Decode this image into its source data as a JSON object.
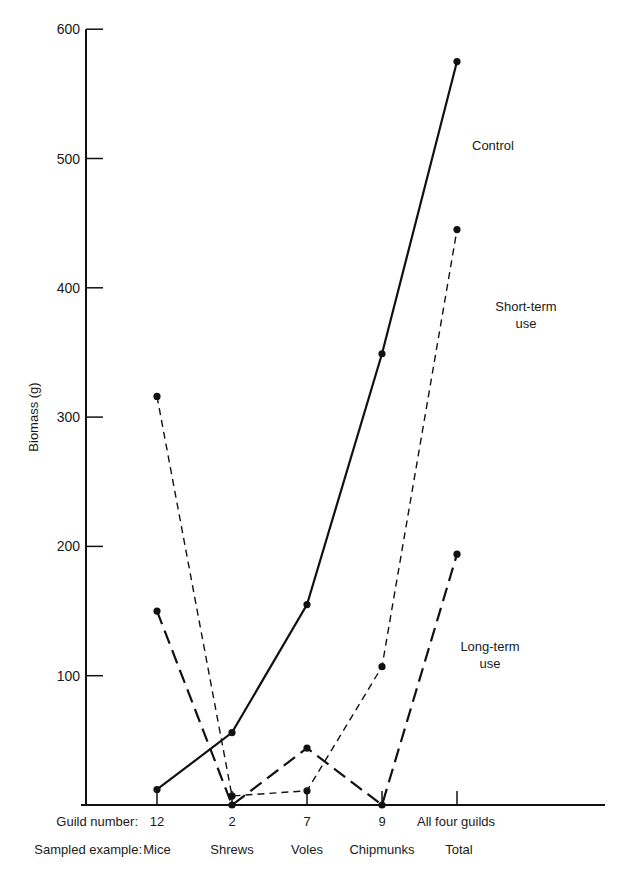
{
  "chart_data": {
    "type": "line",
    "title": "",
    "xlabel": "",
    "ylabel": "Biomass (g)",
    "ylim": [
      0,
      600
    ],
    "yticks": [
      100,
      200,
      300,
      400,
      500,
      600
    ],
    "grid": false,
    "row_labels": {
      "guild": "Guild number:",
      "example": "Sampled example:"
    },
    "categories": [
      "12",
      "2",
      "7",
      "9",
      "All four guilds"
    ],
    "examples": [
      "Mice",
      "Shrews",
      "Voles",
      "Chipmunks",
      "Total"
    ],
    "series": [
      {
        "name": "Control",
        "style": "solid",
        "values": [
          12,
          56,
          155,
          349,
          575
        ],
        "label_lines": [
          "Control"
        ]
      },
      {
        "name": "Short-term use",
        "style": "short-dash",
        "values": [
          316,
          7,
          11,
          107,
          445
        ],
        "label_lines": [
          "Short-term",
          "use"
        ]
      },
      {
        "name": "Long-term use",
        "style": "long-dash",
        "values": [
          150,
          0,
          44,
          0,
          194
        ],
        "label_lines": [
          "Long-term",
          "use"
        ]
      }
    ],
    "legend_position": "inline labels near right end of each line"
  }
}
